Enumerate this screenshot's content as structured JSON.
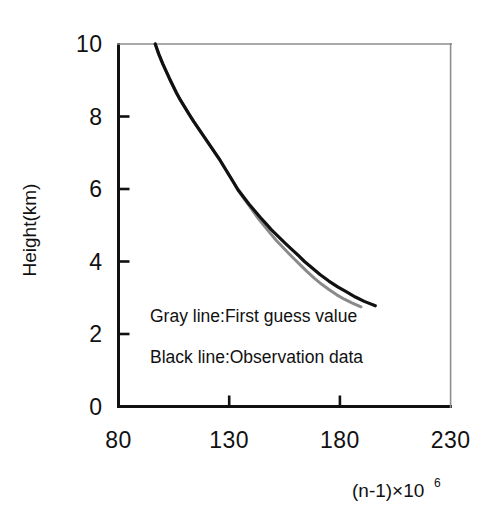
{
  "chart_data": {
    "type": "line",
    "title": "",
    "subtitle": "",
    "xlabel": "(n-1)×10",
    "xlabel_superscript": "6",
    "ylabel": "Height(km)",
    "xlim": [
      80,
      230
    ],
    "ylim": [
      0,
      10
    ],
    "xticks": [
      80,
      130,
      180,
      230
    ],
    "xtick_labels": [
      "80",
      "130",
      "180",
      "230"
    ],
    "yticks": [
      0,
      2,
      4,
      6,
      8,
      10
    ],
    "ytick_labels": [
      "0",
      "2",
      "4",
      "6",
      "8",
      "10"
    ],
    "grid": false,
    "legend_position": "inside-lower-left",
    "annotations": [
      "Gray line:First guess value",
      "Black line:Observation data"
    ],
    "series": [
      {
        "name": "Observation data",
        "label": "Black line:Observation data",
        "color": "#111111",
        "linewidth": 3.2,
        "x": [
          96.6,
          98.2,
          100.0,
          101.5,
          103.0,
          104.6,
          106.2,
          108.0,
          110.0,
          112.0,
          114.0,
          116.0,
          118.0,
          120.0,
          122.0,
          124.0,
          126.0,
          128.0,
          130.0,
          132.0,
          134.0,
          136.5,
          139.0,
          141.5,
          144.0,
          146.5,
          149.0,
          152.0,
          155.0,
          158.0,
          161.0,
          164.0,
          167.5,
          171.0,
          175.0,
          179.0,
          183.0,
          187.0,
          191.0,
          196.0
        ],
        "y": [
          10.0,
          9.72,
          9.45,
          9.25,
          9.05,
          8.85,
          8.65,
          8.45,
          8.25,
          8.05,
          7.86,
          7.68,
          7.5,
          7.32,
          7.14,
          6.96,
          6.78,
          6.58,
          6.38,
          6.18,
          5.98,
          5.78,
          5.58,
          5.4,
          5.22,
          5.05,
          4.88,
          4.7,
          4.52,
          4.35,
          4.18,
          4.0,
          3.82,
          3.64,
          3.46,
          3.3,
          3.16,
          3.02,
          2.9,
          2.78
        ]
      },
      {
        "name": "First guess value",
        "label": "Gray line:First guess value",
        "color": "#8a8a8a",
        "linewidth": 3.0,
        "x": [
          96.6,
          98.2,
          100.0,
          101.5,
          103.0,
          104.6,
          106.2,
          108.0,
          110.0,
          112.0,
          114.0,
          116.0,
          118.0,
          120.0,
          122.0,
          124.0,
          126.0,
          128.0,
          130.0,
          132.0,
          134.0,
          136.5,
          139.0,
          141.3,
          143.6,
          146.0,
          148.4,
          151.0,
          153.8,
          156.6,
          159.4,
          162.2,
          165.2,
          168.4,
          171.8,
          175.2,
          178.6,
          182.0,
          185.4,
          189.5
        ],
        "y": [
          10.0,
          9.72,
          9.45,
          9.25,
          9.05,
          8.85,
          8.65,
          8.45,
          8.25,
          8.05,
          7.86,
          7.68,
          7.5,
          7.32,
          7.14,
          6.96,
          6.78,
          6.58,
          6.38,
          6.18,
          5.96,
          5.75,
          5.54,
          5.34,
          5.15,
          4.97,
          4.79,
          4.6,
          4.42,
          4.24,
          4.07,
          3.9,
          3.72,
          3.54,
          3.37,
          3.22,
          3.08,
          2.96,
          2.86,
          2.75
        ]
      }
    ]
  },
  "colors": {
    "axis": "#111111",
    "background": "#ffffff",
    "observation": "#111111",
    "first_guess": "#8a8a8a"
  }
}
